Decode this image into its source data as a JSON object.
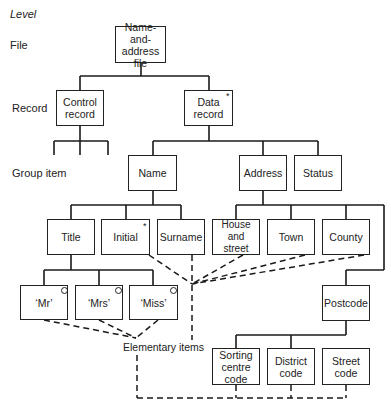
{
  "levels": {
    "heading": "Level",
    "file": "File",
    "record": "Record",
    "group_item": "Group item"
  },
  "nodes": {
    "file": "Name-and-\naddress\nfile",
    "control_record": "Control\nrecord",
    "data_record": "Data\nrecord",
    "name": "Name",
    "address": "Address",
    "status": "Status",
    "title": "Title",
    "initial": "Initial",
    "surname": "Surname",
    "house_street": "House and\nstreet",
    "town": "Town",
    "county": "County",
    "postcode": "Postcode",
    "mr": "‘Mr’",
    "mrs": "‘Mrs’",
    "miss": "‘Miss’",
    "sorting_centre_code": "Sorting\ncentre\ncode",
    "district_code": "District\ncode",
    "street_code": "Street\ncode"
  },
  "markers": {
    "repeat": "*",
    "selection": "o"
  },
  "annotations": {
    "elementary_items": "Elementary items"
  }
}
